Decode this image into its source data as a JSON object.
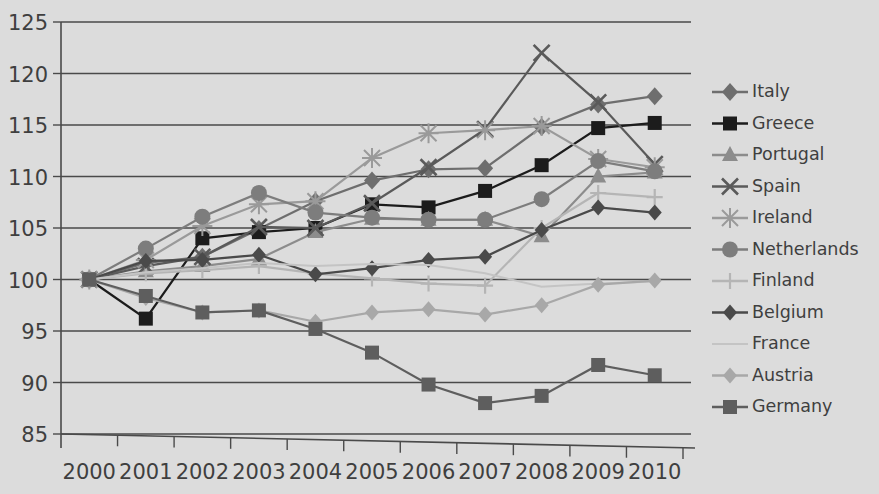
{
  "chart_data": {
    "type": "line",
    "title": "",
    "subtitle": "",
    "xlabel": "",
    "ylabel": "",
    "categories": [
      "2000",
      "2001",
      "2002",
      "2003",
      "2004",
      "2005",
      "2006",
      "2007",
      "2008",
      "2009",
      "2010"
    ],
    "ylim": [
      85,
      125
    ],
    "yticks": [
      85,
      90,
      95,
      100,
      105,
      110,
      115,
      120,
      125
    ],
    "grid": true,
    "legend_position": "right",
    "series": [
      {
        "name": "Italy",
        "marker": "diamond",
        "color": "#6e6e6e",
        "values": [
          100.0,
          101.6,
          102.2,
          104.9,
          107.6,
          109.6,
          110.7,
          110.8,
          114.8,
          117.0,
          117.8
        ]
      },
      {
        "name": "Greece",
        "marker": "square",
        "color": "#1c1c1c",
        "values": [
          100.0,
          96.2,
          104.0,
          104.6,
          105.0,
          107.3,
          107.0,
          108.6,
          111.1,
          114.7,
          115.2
        ]
      },
      {
        "name": "Portugal",
        "marker": "triangle",
        "color": "#8c8c8c",
        "values": [
          100.0,
          100.8,
          101.3,
          102.0,
          104.6,
          105.9,
          105.8,
          105.8,
          104.2,
          110.0,
          110.4
        ]
      },
      {
        "name": "Spain",
        "marker": "cross-x",
        "color": "#5a5a5a",
        "values": [
          100.0,
          101.3,
          102.2,
          105.1,
          105.0,
          107.4,
          110.9,
          114.6,
          122.0,
          117.2,
          111.2
        ]
      },
      {
        "name": "Ireland",
        "marker": "asterisk",
        "color": "#9a9a9a",
        "values": [
          100.0,
          101.9,
          105.2,
          107.3,
          107.6,
          111.8,
          114.2,
          114.5,
          114.9,
          111.7,
          110.9
        ]
      },
      {
        "name": "Netherlands",
        "marker": "circle",
        "color": "#7d7d7d",
        "values": [
          100.0,
          103.0,
          106.1,
          108.4,
          106.5,
          106.0,
          105.8,
          105.8,
          107.8,
          111.5,
          110.5
        ]
      },
      {
        "name": "Finland",
        "marker": "plus",
        "color": "#b5b5b5",
        "values": [
          100.0,
          100.6,
          100.9,
          101.3,
          100.6,
          100.1,
          99.6,
          99.4,
          105.0,
          108.4,
          108.0
        ]
      },
      {
        "name": "Belgium",
        "marker": "diamond-small",
        "color": "#4a4a4a",
        "values": [
          100.0,
          101.8,
          101.9,
          102.4,
          100.5,
          101.1,
          101.9,
          102.2,
          104.8,
          107.0,
          106.5
        ]
      },
      {
        "name": "France",
        "marker": "none",
        "color": "#c4c4c4",
        "values": [
          100.0,
          100.7,
          101.1,
          101.6,
          101.3,
          101.5,
          101.4,
          100.6,
          99.3,
          99.6,
          99.8
        ]
      },
      {
        "name": "Austria",
        "marker": "diamond-small",
        "color": "#a8a8a8",
        "values": [
          100.0,
          98.2,
          96.8,
          97.0,
          95.9,
          96.8,
          97.1,
          96.6,
          97.5,
          99.5,
          99.9
        ]
      },
      {
        "name": "Germany",
        "marker": "square",
        "color": "#5e5e5e",
        "values": [
          100.0,
          98.4,
          96.8,
          97.0,
          95.2,
          92.9,
          89.8,
          88.0,
          88.7,
          91.7,
          90.7
        ]
      }
    ]
  },
  "legend": {
    "items": [
      {
        "label": "Italy"
      },
      {
        "label": "Greece"
      },
      {
        "label": "Portugal"
      },
      {
        "label": "Spain"
      },
      {
        "label": "Ireland"
      },
      {
        "label": "Netherlands"
      },
      {
        "label": "Finland"
      },
      {
        "label": "Belgium"
      },
      {
        "label": "France"
      },
      {
        "label": "Austria"
      },
      {
        "label": "Germany"
      }
    ]
  },
  "theme": {
    "background": "#dcdcdc",
    "axis_color": "#4a4a4a",
    "text_color": "#3f3f3f"
  }
}
